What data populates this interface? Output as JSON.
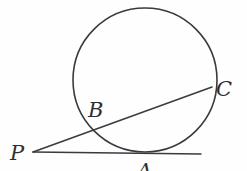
{
  "figure": {
    "name": "circle-tangent-secant-diagram",
    "background_color": "#fefefe",
    "stroke_color": "#3a3a40",
    "label_color": "#2e2e33",
    "canvas": {
      "width": 247,
      "height": 171
    }
  },
  "circle": {
    "name": "main-circle",
    "center_x": 145,
    "center_y": 80,
    "radius": 72,
    "stroke_width": 1.6
  },
  "points": {
    "P": {
      "label": "P",
      "x": 33,
      "y": 152,
      "label_x": 10,
      "label_y": 160
    },
    "A": {
      "label": "A",
      "x": 145,
      "y": 152,
      "label_x": 137,
      "label_y": 178
    },
    "B": {
      "label": "B",
      "x": 94,
      "y": 131,
      "label_x": 88,
      "label_y": 117
    },
    "C": {
      "label": "C",
      "x": 211,
      "y": 88,
      "label_x": 216,
      "label_y": 96
    }
  },
  "segments": {
    "tangent": {
      "name": "tangent-line-PA",
      "x1": 33,
      "y1": 152,
      "x2": 201,
      "y2": 154
    },
    "secant": {
      "name": "secant-line-PC",
      "x1": 33,
      "y1": 152,
      "x2": 212,
      "y2": 87
    }
  }
}
